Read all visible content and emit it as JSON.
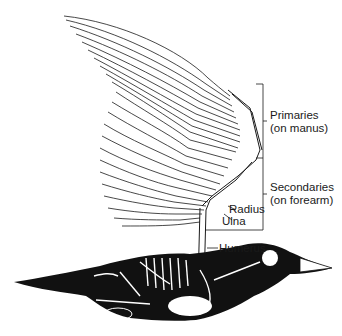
{
  "figure": {
    "labels": {
      "primaries": {
        "line1": "Primaries",
        "line2": "(on manus)"
      },
      "secondaries": {
        "line1": "Secondaries",
        "line2": "(on forearm)"
      },
      "radius": "Radius",
      "ulna": "Ulna",
      "humerus": "Humerus"
    },
    "colors": {
      "ink": "#1a1a1a",
      "background": "#ffffff"
    }
  }
}
